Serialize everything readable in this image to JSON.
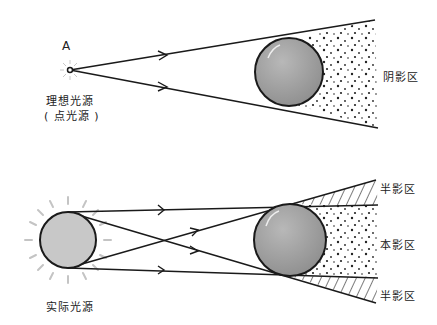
{
  "top_diagram": {
    "point_label": "A",
    "source_label_line1": "理想光源",
    "source_label_line2": "( 点光源 )",
    "shadow_label": "阴影区"
  },
  "bottom_diagram": {
    "source_label": "实际光源",
    "penumbra_top_label": "半影区",
    "umbra_label": "本影区",
    "penumbra_bottom_label": "半影区"
  },
  "colors": {
    "line": "#1a1a1a",
    "sphere_fill": "#a8a8a8",
    "source_fill": "#c8c8c8",
    "glow": "#bbbbbb"
  }
}
